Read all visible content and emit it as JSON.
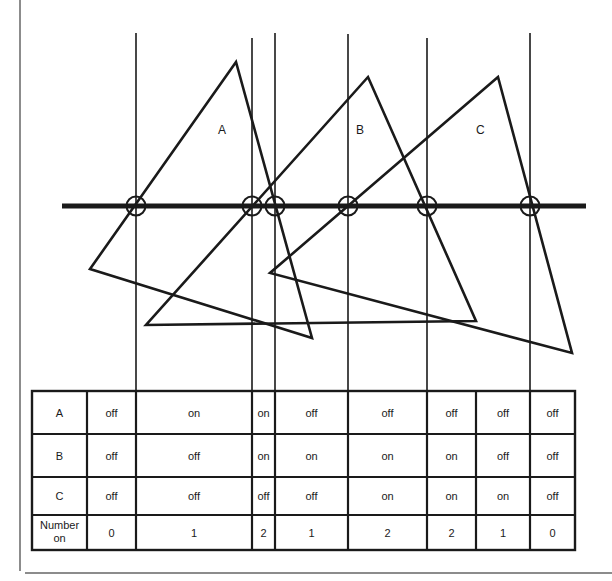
{
  "figure": {
    "triangles": [
      {
        "label": "A"
      },
      {
        "label": "B"
      },
      {
        "label": "C"
      }
    ],
    "sample_lines_count": 6,
    "colors": {
      "ink": "#1a1a1a",
      "background": "#ffffff",
      "border": "#555555"
    }
  },
  "table": {
    "rows": [
      {
        "header": "A",
        "cells": [
          "off",
          "on",
          "on",
          "off",
          "off",
          "off",
          "off",
          "off"
        ]
      },
      {
        "header": "B",
        "cells": [
          "off",
          "off",
          "on",
          "on",
          "on",
          "on",
          "off",
          "off"
        ]
      },
      {
        "header": "C",
        "cells": [
          "off",
          "off",
          "off",
          "off",
          "on",
          "on",
          "on",
          "off"
        ]
      },
      {
        "header": "Number on",
        "header_lines": [
          "Number",
          "on"
        ],
        "cells": [
          "0",
          "1",
          "2",
          "1",
          "2",
          "2",
          "1",
          "0"
        ]
      }
    ]
  }
}
